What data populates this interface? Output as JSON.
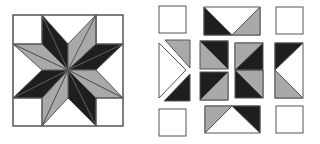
{
  "diagram": {
    "title": "",
    "colors": {
      "dark": "#1e1e1e",
      "gray": "#a9a9a9",
      "light": "#ffffff",
      "stroke": "#555555"
    },
    "assembled_block": {
      "label": "",
      "description": "Eight-pointed star quilt block, assembled",
      "outer": [
        13,
        15,
        110,
        111
      ]
    },
    "exploded_block": {
      "label": "",
      "description": "Same block shown as separated pieces",
      "corner_squares": 4,
      "edge_units": 4,
      "center_units": 3
    }
  }
}
